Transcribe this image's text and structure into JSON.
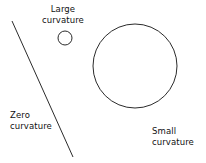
{
  "figure": {
    "width": 206,
    "height": 163,
    "background_color": "#ffffff",
    "stroke_color": "#2b2b2b",
    "text_color": "#111111"
  },
  "labels": {
    "large_curvature": {
      "line1": "Large",
      "line2": "curvature"
    },
    "zero_curvature": {
      "line1": "Zero",
      "line2": "curvature"
    },
    "small_curvature": {
      "line1": "Small",
      "line2": "curvature"
    }
  },
  "chart_data": {
    "type": "diagram",
    "title": "",
    "shapes": [
      {
        "name": "zero-curvature-line",
        "kind": "line",
        "label": "Zero curvature",
        "x1": 12,
        "y1": 21,
        "x2": 73,
        "y2": 157
      },
      {
        "name": "large-curvature-circle",
        "kind": "circle",
        "label": "Large curvature",
        "cx": 65,
        "cy": 38,
        "r": 7
      },
      {
        "name": "small-curvature-circle",
        "kind": "circle",
        "label": "Small curvature",
        "cx": 135,
        "cy": 66,
        "r": 42
      }
    ]
  }
}
